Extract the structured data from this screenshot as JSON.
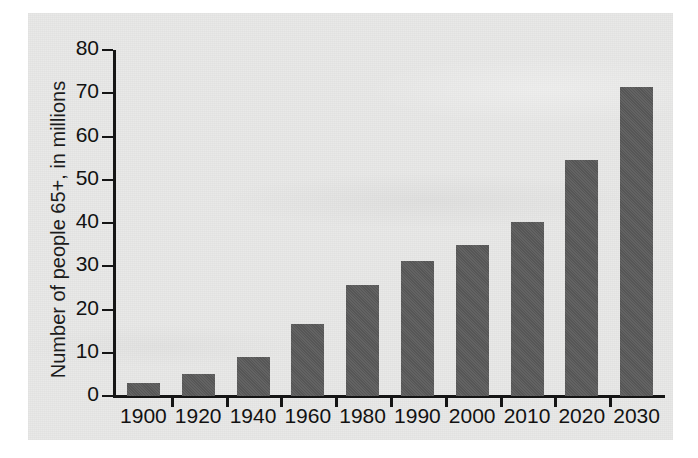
{
  "figure": {
    "panel_background": "#e9e9e8",
    "bar_color": "#5a5a5a",
    "axis_color": "#151515"
  },
  "chart_data": {
    "type": "bar",
    "title": "",
    "xlabel": "",
    "ylabel": "Number of people 65+, in millions",
    "categories": [
      "1900",
      "1920",
      "1940",
      "1960",
      "1980",
      "1990",
      "2000",
      "2010",
      "2020",
      "2030"
    ],
    "values": [
      3.1,
      5.0,
      9.0,
      16.7,
      25.7,
      31.2,
      35.0,
      40.2,
      54.6,
      71.5
    ],
    "ylim": [
      0,
      80
    ],
    "yticks": [
      0,
      10,
      20,
      30,
      40,
      50,
      60,
      70,
      80
    ],
    "ytick_labels": [
      "0",
      "10",
      "20",
      "30",
      "40",
      "50",
      "60",
      "70",
      "80"
    ],
    "grid": false,
    "legend": null
  }
}
